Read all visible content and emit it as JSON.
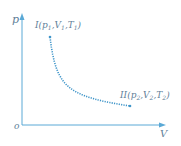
{
  "diagram": {
    "axes": {
      "y_label": "p",
      "x_label": "V",
      "origin_label": "o"
    },
    "states": [
      {
        "id": "I",
        "label_prefix": "I",
        "p": "p",
        "p_sub": "1",
        "V": "V",
        "V_sub": "1",
        "T": "T",
        "T_sub": "1"
      },
      {
        "id": "II",
        "label_prefix": "II",
        "p": "p",
        "p_sub": "2",
        "V": "V",
        "V_sub": "2",
        "T": "T",
        "T_sub": "2"
      }
    ],
    "curve": {
      "type": "hyperbola",
      "from": "I",
      "to": "II",
      "style": "dotted"
    },
    "colors": {
      "axis": "#5aa9d6",
      "curve": "#3f95c9",
      "text": "#5f7f99"
    }
  }
}
